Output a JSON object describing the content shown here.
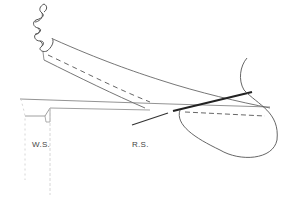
{
  "diagram": {
    "labels": {
      "ws": "W.S.",
      "rs": "R.S."
    },
    "colors": {
      "line": "#555555",
      "bold_line": "#222222",
      "faint": "#bbbbbb"
    }
  }
}
